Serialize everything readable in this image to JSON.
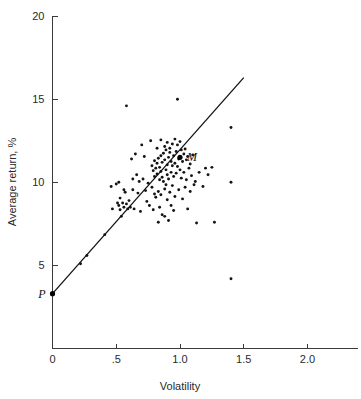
{
  "figure": {
    "background_color": "#ffffff",
    "ink_color": "#141414"
  },
  "chart_data": {
    "type": "scatter",
    "title": "",
    "xlabel": "Volatility",
    "ylabel": "Average return, %",
    "xlim": [
      0,
      2.35
    ],
    "ylim": [
      0,
      20
    ],
    "grid": false,
    "legend": false,
    "x_ticks": [
      0,
      0.5,
      1.0,
      1.5,
      2.0
    ],
    "x_tick_labels": [
      "0",
      ".5",
      "1.0",
      "1.5",
      "2.0"
    ],
    "y_ticks": [
      5,
      10,
      15,
      20
    ],
    "y_tick_labels": [
      "5",
      "10",
      "15",
      "20"
    ],
    "annotations": [
      {
        "label": "P",
        "x": 0.0,
        "y": 3.3,
        "note": "risk-free / zero-beta intercept"
      },
      {
        "label": "M",
        "x": 1.0,
        "y": 11.5,
        "note": "market portfolio"
      }
    ],
    "series": [
      {
        "name": "Securities",
        "marker": "dot",
        "points": [
          [
            0.22,
            5.1
          ],
          [
            0.27,
            5.6
          ],
          [
            0.41,
            6.85
          ],
          [
            0.46,
            9.75
          ],
          [
            0.47,
            8.4
          ],
          [
            0.5,
            9.9
          ],
          [
            0.51,
            8.75
          ],
          [
            0.52,
            10.0
          ],
          [
            0.52,
            8.6
          ],
          [
            0.53,
            9.05
          ],
          [
            0.53,
            8.35
          ],
          [
            0.54,
            7.95
          ],
          [
            0.55,
            8.75
          ],
          [
            0.56,
            9.55
          ],
          [
            0.56,
            8.5
          ],
          [
            0.57,
            9.4
          ],
          [
            0.58,
            14.6
          ],
          [
            0.58,
            8.7
          ],
          [
            0.59,
            8.4
          ],
          [
            0.6,
            8.9
          ],
          [
            0.61,
            8.5
          ],
          [
            0.62,
            11.4
          ],
          [
            0.63,
            10.2
          ],
          [
            0.63,
            9.55
          ],
          [
            0.64,
            8.4
          ],
          [
            0.65,
            11.7
          ],
          [
            0.66,
            10.45
          ],
          [
            0.67,
            9.35
          ],
          [
            0.68,
            10.05
          ],
          [
            0.69,
            8.25
          ],
          [
            0.7,
            12.25
          ],
          [
            0.71,
            10.2
          ],
          [
            0.72,
            11.55
          ],
          [
            0.73,
            9.5
          ],
          [
            0.74,
            8.85
          ],
          [
            0.75,
            9.95
          ],
          [
            0.76,
            8.6
          ],
          [
            0.77,
            12.5
          ],
          [
            0.78,
            11.0
          ],
          [
            0.78,
            9.7
          ],
          [
            0.79,
            10.7
          ],
          [
            0.79,
            8.35
          ],
          [
            0.8,
            11.3
          ],
          [
            0.8,
            10.35
          ],
          [
            0.8,
            9.3
          ],
          [
            0.81,
            10.85
          ],
          [
            0.81,
            9.1
          ],
          [
            0.82,
            12.05
          ],
          [
            0.82,
            11.15
          ],
          [
            0.82,
            10.5
          ],
          [
            0.83,
            11.45
          ],
          [
            0.83,
            9.45
          ],
          [
            0.83,
            7.6
          ],
          [
            0.84,
            10.9
          ],
          [
            0.84,
            10.15
          ],
          [
            0.84,
            8.5
          ],
          [
            0.85,
            12.55
          ],
          [
            0.85,
            11.6
          ],
          [
            0.85,
            10.65
          ],
          [
            0.85,
            9.25
          ],
          [
            0.86,
            11.2
          ],
          [
            0.86,
            10.3
          ],
          [
            0.86,
            8.05
          ],
          [
            0.87,
            11.75
          ],
          [
            0.87,
            10.05
          ],
          [
            0.88,
            12.15
          ],
          [
            0.88,
            11.35
          ],
          [
            0.88,
            9.6
          ],
          [
            0.88,
            7.95
          ],
          [
            0.89,
            11.95
          ],
          [
            0.89,
            10.75
          ],
          [
            0.89,
            9.85
          ],
          [
            0.9,
            12.4
          ],
          [
            0.9,
            11.05
          ],
          [
            0.9,
            10.45
          ],
          [
            0.9,
            8.95
          ],
          [
            0.91,
            11.5
          ],
          [
            0.91,
            10.2
          ],
          [
            0.91,
            7.7
          ],
          [
            0.92,
            12.05
          ],
          [
            0.92,
            11.8
          ],
          [
            0.92,
            9.4
          ],
          [
            0.93,
            11.25
          ],
          [
            0.93,
            10.6
          ],
          [
            0.93,
            8.6
          ],
          [
            0.94,
            12.3
          ],
          [
            0.94,
            11.0
          ],
          [
            0.94,
            9.8
          ],
          [
            0.95,
            11.6
          ],
          [
            0.95,
            10.35
          ],
          [
            0.95,
            8.3
          ],
          [
            0.96,
            12.6
          ],
          [
            0.96,
            11.15
          ],
          [
            0.96,
            9.15
          ],
          [
            0.97,
            11.85
          ],
          [
            0.97,
            10.55
          ],
          [
            0.98,
            15.0
          ],
          [
            0.98,
            12.25
          ],
          [
            0.98,
            10.95
          ],
          [
            0.99,
            11.4
          ],
          [
            0.99,
            9.55
          ],
          [
            1.0,
            12.45
          ],
          [
            1.0,
            11.5
          ],
          [
            1.0,
            10.75
          ],
          [
            1.01,
            11.95
          ],
          [
            1.01,
            10.25
          ],
          [
            1.02,
            11.25
          ],
          [
            1.02,
            9.0
          ],
          [
            1.03,
            11.7
          ],
          [
            1.03,
            10.6
          ],
          [
            1.04,
            12.0
          ],
          [
            1.04,
            9.7
          ],
          [
            1.05,
            11.35
          ],
          [
            1.05,
            10.15
          ],
          [
            1.06,
            11.55
          ],
          [
            1.06,
            8.4
          ],
          [
            1.07,
            10.85
          ],
          [
            1.08,
            11.1
          ],
          [
            1.08,
            9.45
          ],
          [
            1.09,
            10.4
          ],
          [
            1.1,
            11.65
          ],
          [
            1.11,
            9.85
          ],
          [
            1.12,
            10.05
          ],
          [
            1.13,
            7.55
          ],
          [
            1.15,
            10.6
          ],
          [
            1.18,
            9.75
          ],
          [
            1.2,
            10.85
          ],
          [
            1.22,
            10.45
          ],
          [
            1.25,
            10.9
          ],
          [
            1.27,
            7.6
          ],
          [
            1.4,
            13.3
          ],
          [
            1.4,
            10.0
          ],
          [
            1.4,
            4.2
          ]
        ]
      }
    ],
    "fit_line": {
      "name": "Security market line",
      "x_start": 0.0,
      "y_start": 3.3,
      "x_end": 1.5,
      "y_end": 16.3,
      "intercept": 3.3,
      "slope": 8.667
    }
  }
}
